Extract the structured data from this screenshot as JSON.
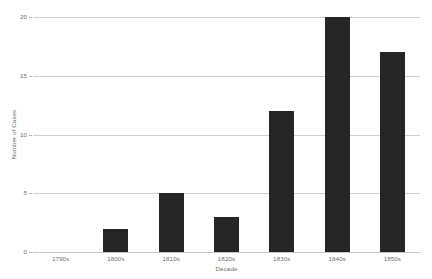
{
  "chart_data": {
    "type": "bar",
    "title": "",
    "xlabel": "Decade",
    "ylabel": "Number of Cases",
    "categories": [
      "1790s",
      "1800s",
      "1810s",
      "1820s",
      "1830s",
      "1840s",
      "1850s"
    ],
    "values": [
      0,
      2,
      5,
      3,
      12,
      20,
      17
    ],
    "ylim": [
      0,
      20
    ],
    "yticks": [
      0,
      5,
      10,
      15,
      20
    ],
    "ytick_labels": [
      "0",
      "5",
      "10",
      "15",
      "20"
    ],
    "grid": "horizontal",
    "legend": "none",
    "series": [
      {
        "name": "Number of Cases",
        "values": [
          0,
          2,
          5,
          3,
          12,
          20,
          17
        ]
      }
    ],
    "colors": {
      "bar": "#262626",
      "gridline": "#d0d0d0",
      "text": "#6e6e6e",
      "background": "#ffffff"
    }
  }
}
